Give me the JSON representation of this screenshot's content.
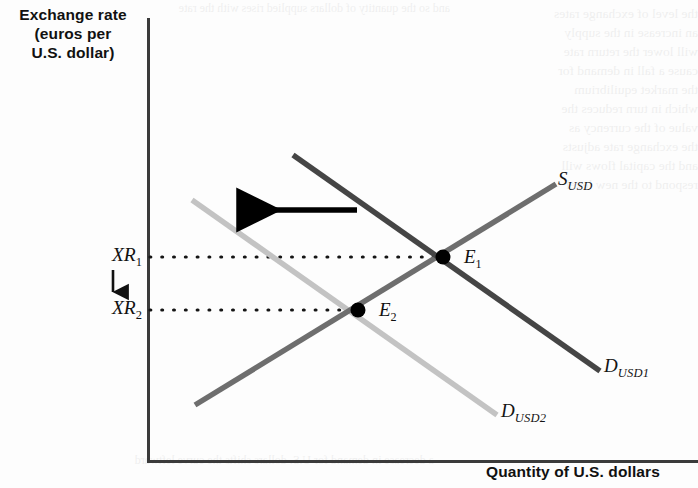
{
  "figure": {
    "kind": "supply-demand-diagram",
    "width": 698,
    "height": 488
  },
  "axes": {
    "y_title": "Exchange rate\n(euros per\nU.S. dollar)",
    "x_title": "Quantity of U.S. dollars",
    "origin": {
      "x": 148,
      "y": 462
    },
    "y_axis_top": 18,
    "x_axis_right": 698,
    "axis_color": "#3b3b3b"
  },
  "curves": {
    "supply": {
      "label_main": "S",
      "label_sub": "USD",
      "color": "#6e6e6e",
      "x1": 195,
      "y1": 405,
      "x2": 556,
      "y2": 184,
      "width": 5
    },
    "demand1": {
      "label_main": "D",
      "label_sub": "USD1",
      "color": "#454545",
      "x1": 293,
      "y1": 155,
      "x2": 600,
      "y2": 371,
      "width": 5
    },
    "demand2": {
      "label_main": "D",
      "label_sub": "USD2",
      "color": "#c3c3c3",
      "x1": 192,
      "y1": 200,
      "x2": 497,
      "y2": 415,
      "width": 5
    }
  },
  "equilibria": [
    {
      "name": "E1",
      "label_main": "E",
      "label_sub": "1",
      "x": 443,
      "y": 257,
      "dot_color": "#000000",
      "dot_radius": 7
    },
    {
      "name": "E2",
      "label_main": "E",
      "label_sub": "2",
      "x": 358,
      "y": 310,
      "dot_color": "#000000",
      "dot_radius": 7
    }
  ],
  "price_levels": [
    {
      "name": "XR1",
      "label_main": "XR",
      "label_sub": "1",
      "y": 257,
      "dotted_to_x": 443,
      "dot_color": "#111111"
    },
    {
      "name": "XR2",
      "label_main": "XR",
      "label_sub": "2",
      "y": 310,
      "dotted_to_x": 358,
      "dot_color": "#111111"
    }
  ],
  "annotations": {
    "price_change_arrow": {
      "meaning": "exchange rate falls",
      "direction": "down",
      "x": 113,
      "y_from": 270,
      "y_to": 296,
      "color": "#111111"
    },
    "shift_arrow": {
      "meaning": "demand for U.S. dollars decreases",
      "direction": "left",
      "x_from": 357,
      "x_to": 230,
      "y": 210,
      "color": "#000000",
      "width": 5
    }
  },
  "ghost_text": {
    "right": "the level of exchange rates\nan increase in the supply\nwill lower the return rate\ncause a fall in demand for\nthe market equilibrium\nwhich in turn reduces the\nvalue of the currency as\nthe exchange rate adjusts\nand the capital flows will\nrespond to the new level",
    "top": "and so the quantity of dollars supplied rises with the rate",
    "bottom": "a decrease in demand for U.S. dollars shifts the curve leftward"
  }
}
